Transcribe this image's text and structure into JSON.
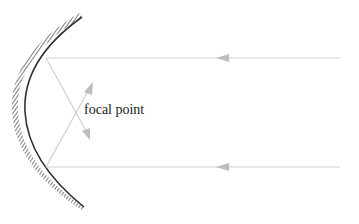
{
  "diagram": {
    "labels": {
      "focal_point": "focal point"
    },
    "elements": {
      "mirror": "concave mirror (hatched back)",
      "incoming_rays": 2,
      "reflected_rays": 2
    },
    "colors": {
      "ray": "#c8c8c8",
      "arrowhead": "#b8b8b8",
      "mirror": "#333333",
      "text": "#222222"
    }
  }
}
